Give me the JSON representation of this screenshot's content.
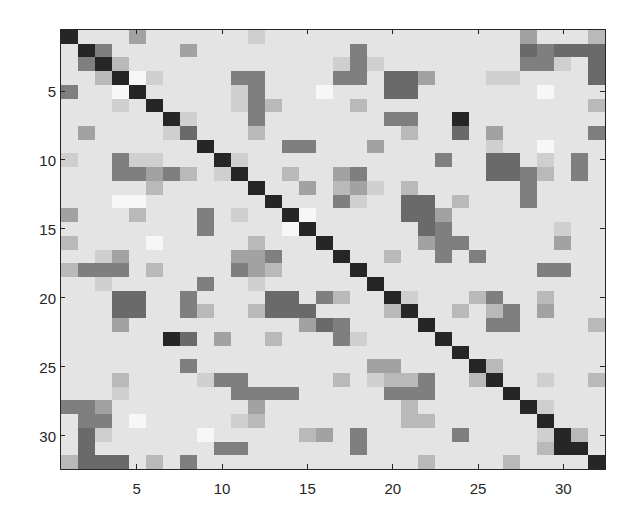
{
  "chart_data": {
    "type": "heatmap",
    "title": "",
    "xlabel": "",
    "ylabel": "",
    "colormap": "gray (dark = high)",
    "size": [
      32,
      32
    ],
    "x_ticks": [
      5,
      10,
      15,
      20,
      25,
      30
    ],
    "y_ticks": [
      5,
      10,
      15,
      20,
      25,
      30
    ],
    "xlim": [
      0.5,
      32.5
    ],
    "ylim": [
      0.5,
      32.5
    ],
    "value_scale": "0 = lightest (white), 9 = darkest (black)",
    "matrix": [
      [
        9,
        2,
        2,
        2,
        5,
        2,
        2,
        2,
        2,
        2,
        2,
        3,
        2,
        2,
        2,
        2,
        2,
        2,
        2,
        2,
        2,
        2,
        2,
        2,
        2,
        2,
        2,
        5,
        2,
        2,
        2,
        4
      ],
      [
        2,
        9,
        6,
        2,
        2,
        2,
        2,
        5,
        2,
        2,
        2,
        2,
        2,
        2,
        2,
        2,
        2,
        6,
        2,
        2,
        2,
        2,
        2,
        2,
        2,
        2,
        2,
        7,
        6,
        7,
        7,
        7
      ],
      [
        2,
        6,
        9,
        4,
        2,
        2,
        2,
        2,
        2,
        2,
        2,
        2,
        2,
        2,
        2,
        2,
        3,
        6,
        3,
        2,
        2,
        2,
        2,
        2,
        2,
        2,
        2,
        6,
        6,
        3,
        2,
        7
      ],
      [
        2,
        2,
        4,
        9,
        0,
        3,
        2,
        2,
        2,
        2,
        6,
        6,
        2,
        2,
        2,
        2,
        6,
        6,
        2,
        7,
        7,
        5,
        2,
        2,
        2,
        3,
        3,
        2,
        2,
        2,
        2,
        7
      ],
      [
        6,
        2,
        2,
        0,
        9,
        2,
        2,
        2,
        2,
        2,
        3,
        6,
        2,
        2,
        2,
        0,
        2,
        2,
        2,
        7,
        7,
        2,
        2,
        2,
        2,
        2,
        2,
        2,
        0,
        2,
        2,
        2
      ],
      [
        2,
        2,
        2,
        3,
        2,
        9,
        2,
        2,
        2,
        2,
        3,
        6,
        4,
        2,
        2,
        2,
        2,
        4,
        2,
        2,
        2,
        2,
        2,
        2,
        2,
        2,
        2,
        2,
        2,
        2,
        2,
        4
      ],
      [
        2,
        2,
        2,
        2,
        2,
        2,
        9,
        3,
        2,
        2,
        2,
        6,
        2,
        2,
        2,
        2,
        2,
        2,
        2,
        6,
        6,
        2,
        2,
        9,
        2,
        2,
        2,
        2,
        2,
        2,
        2,
        2
      ],
      [
        2,
        5,
        2,
        2,
        2,
        2,
        3,
        7,
        2,
        2,
        2,
        4,
        2,
        2,
        2,
        2,
        2,
        2,
        2,
        2,
        4,
        2,
        2,
        7,
        2,
        5,
        2,
        2,
        2,
        2,
        2,
        6
      ],
      [
        2,
        2,
        2,
        2,
        2,
        2,
        2,
        2,
        9,
        2,
        2,
        2,
        2,
        6,
        6,
        2,
        2,
        2,
        5,
        2,
        2,
        2,
        2,
        2,
        2,
        3,
        2,
        2,
        0,
        2,
        2,
        2
      ],
      [
        3,
        2,
        2,
        6,
        3,
        3,
        2,
        2,
        2,
        9,
        3,
        2,
        2,
        2,
        2,
        2,
        2,
        2,
        2,
        2,
        2,
        2,
        6,
        2,
        2,
        7,
        7,
        2,
        3,
        2,
        6,
        2
      ],
      [
        2,
        2,
        2,
        6,
        6,
        5,
        6,
        4,
        2,
        3,
        9,
        2,
        2,
        4,
        2,
        2,
        5,
        6,
        2,
        2,
        2,
        2,
        2,
        2,
        2,
        7,
        7,
        6,
        4,
        2,
        6,
        2
      ],
      [
        2,
        2,
        2,
        2,
        2,
        4,
        2,
        2,
        2,
        2,
        2,
        9,
        2,
        2,
        5,
        2,
        4,
        5,
        3,
        2,
        4,
        2,
        2,
        2,
        2,
        2,
        2,
        6,
        2,
        2,
        2,
        2
      ],
      [
        2,
        2,
        2,
        0,
        0,
        2,
        2,
        2,
        2,
        2,
        2,
        2,
        9,
        2,
        2,
        2,
        6,
        3,
        2,
        2,
        7,
        7,
        2,
        4,
        2,
        2,
        2,
        6,
        2,
        2,
        2,
        2
      ],
      [
        5,
        2,
        2,
        2,
        4,
        2,
        2,
        2,
        6,
        2,
        3,
        2,
        2,
        9,
        0,
        2,
        2,
        2,
        2,
        2,
        7,
        7,
        5,
        2,
        2,
        2,
        2,
        2,
        2,
        2,
        2,
        2
      ],
      [
        2,
        2,
        2,
        2,
        2,
        2,
        2,
        2,
        6,
        2,
        2,
        2,
        2,
        0,
        9,
        2,
        2,
        2,
        2,
        2,
        2,
        7,
        6,
        2,
        2,
        2,
        2,
        2,
        2,
        3,
        2,
        2
      ],
      [
        4,
        2,
        2,
        2,
        2,
        0,
        2,
        2,
        2,
        2,
        2,
        4,
        2,
        2,
        2,
        9,
        2,
        2,
        2,
        2,
        2,
        5,
        6,
        6,
        2,
        2,
        2,
        2,
        2,
        5,
        2,
        2
      ],
      [
        2,
        2,
        3,
        5,
        2,
        2,
        2,
        2,
        2,
        2,
        5,
        5,
        6,
        2,
        2,
        2,
        9,
        2,
        2,
        4,
        2,
        2,
        6,
        2,
        6,
        2,
        2,
        2,
        2,
        2,
        2,
        2
      ],
      [
        4,
        6,
        6,
        6,
        2,
        4,
        2,
        2,
        2,
        2,
        6,
        5,
        4,
        2,
        2,
        2,
        2,
        9,
        2,
        2,
        2,
        2,
        2,
        2,
        2,
        2,
        2,
        2,
        6,
        6,
        2,
        2
      ],
      [
        2,
        2,
        3,
        2,
        2,
        2,
        2,
        2,
        6,
        2,
        2,
        3,
        2,
        2,
        2,
        2,
        2,
        2,
        9,
        2,
        2,
        2,
        2,
        2,
        2,
        2,
        2,
        2,
        2,
        2,
        2,
        2
      ],
      [
        2,
        2,
        2,
        7,
        7,
        2,
        2,
        6,
        2,
        2,
        2,
        2,
        7,
        7,
        2,
        6,
        4,
        2,
        2,
        9,
        3,
        2,
        2,
        2,
        4,
        6,
        2,
        2,
        4,
        2,
        2,
        2
      ],
      [
        2,
        2,
        2,
        7,
        7,
        2,
        2,
        6,
        4,
        2,
        2,
        4,
        7,
        7,
        7,
        2,
        2,
        2,
        2,
        4,
        9,
        2,
        2,
        4,
        2,
        4,
        6,
        2,
        5,
        2,
        2,
        2
      ],
      [
        2,
        2,
        2,
        5,
        2,
        2,
        2,
        2,
        2,
        2,
        2,
        2,
        2,
        2,
        5,
        7,
        6,
        2,
        2,
        2,
        2,
        9,
        2,
        2,
        2,
        6,
        6,
        2,
        2,
        2,
        2,
        4
      ],
      [
        2,
        2,
        2,
        2,
        2,
        2,
        9,
        7,
        2,
        5,
        2,
        2,
        4,
        2,
        2,
        2,
        6,
        3,
        2,
        2,
        2,
        2,
        9,
        2,
        2,
        2,
        2,
        2,
        2,
        2,
        2,
        2
      ],
      [
        2,
        2,
        2,
        2,
        2,
        2,
        2,
        2,
        2,
        2,
        2,
        2,
        2,
        2,
        2,
        2,
        2,
        2,
        2,
        2,
        2,
        2,
        2,
        9,
        2,
        2,
        2,
        2,
        2,
        2,
        2,
        2
      ],
      [
        2,
        2,
        2,
        2,
        2,
        2,
        2,
        6,
        2,
        2,
        2,
        2,
        2,
        2,
        2,
        2,
        2,
        2,
        5,
        5,
        2,
        2,
        2,
        2,
        9,
        4,
        2,
        2,
        2,
        2,
        2,
        2
      ],
      [
        2,
        2,
        2,
        4,
        2,
        2,
        2,
        2,
        3,
        6,
        6,
        2,
        2,
        2,
        2,
        2,
        4,
        2,
        3,
        4,
        4,
        6,
        2,
        2,
        4,
        9,
        2,
        2,
        3,
        2,
        2,
        4
      ],
      [
        2,
        2,
        2,
        3,
        2,
        2,
        2,
        2,
        2,
        2,
        6,
        6,
        6,
        6,
        2,
        2,
        2,
        2,
        2,
        6,
        6,
        6,
        2,
        2,
        2,
        2,
        9,
        2,
        2,
        2,
        2,
        2
      ],
      [
        6,
        6,
        5,
        2,
        2,
        2,
        2,
        2,
        2,
        2,
        2,
        5,
        2,
        2,
        2,
        2,
        2,
        2,
        2,
        2,
        4,
        2,
        2,
        2,
        2,
        2,
        2,
        9,
        3,
        2,
        2,
        2
      ],
      [
        2,
        6,
        6,
        2,
        0,
        2,
        2,
        2,
        2,
        2,
        3,
        4,
        2,
        2,
        2,
        2,
        2,
        2,
        2,
        2,
        4,
        4,
        2,
        2,
        2,
        2,
        2,
        2,
        9,
        2,
        2,
        2
      ],
      [
        2,
        7,
        3,
        2,
        2,
        2,
        2,
        2,
        0,
        2,
        2,
        2,
        2,
        2,
        4,
        5,
        2,
        6,
        2,
        2,
        2,
        2,
        2,
        6,
        2,
        2,
        2,
        2,
        3,
        9,
        4,
        2
      ],
      [
        2,
        7,
        2,
        2,
        2,
        2,
        2,
        2,
        2,
        6,
        6,
        2,
        2,
        2,
        2,
        2,
        2,
        6,
        2,
        2,
        2,
        2,
        2,
        2,
        2,
        2,
        2,
        2,
        4,
        9,
        9,
        2
      ],
      [
        4,
        7,
        7,
        7,
        2,
        4,
        2,
        6,
        2,
        2,
        2,
        2,
        2,
        2,
        2,
        2,
        2,
        2,
        2,
        2,
        2,
        4,
        2,
        2,
        2,
        2,
        4,
        2,
        2,
        2,
        2,
        9
      ]
    ]
  },
  "palette": [
    "#f7f7f7",
    "#efefef",
    "#e4e4e4",
    "#cfcfcf",
    "#b9b9b9",
    "#a2a2a2",
    "#7f7f7f",
    "#6a6a6a",
    "#4a4a4a",
    "#262626"
  ],
  "axis": {
    "x_tick_labels": [
      "5",
      "10",
      "15",
      "20",
      "25",
      "30"
    ],
    "y_tick_labels": [
      "5",
      "10",
      "15",
      "20",
      "25",
      "30"
    ]
  }
}
